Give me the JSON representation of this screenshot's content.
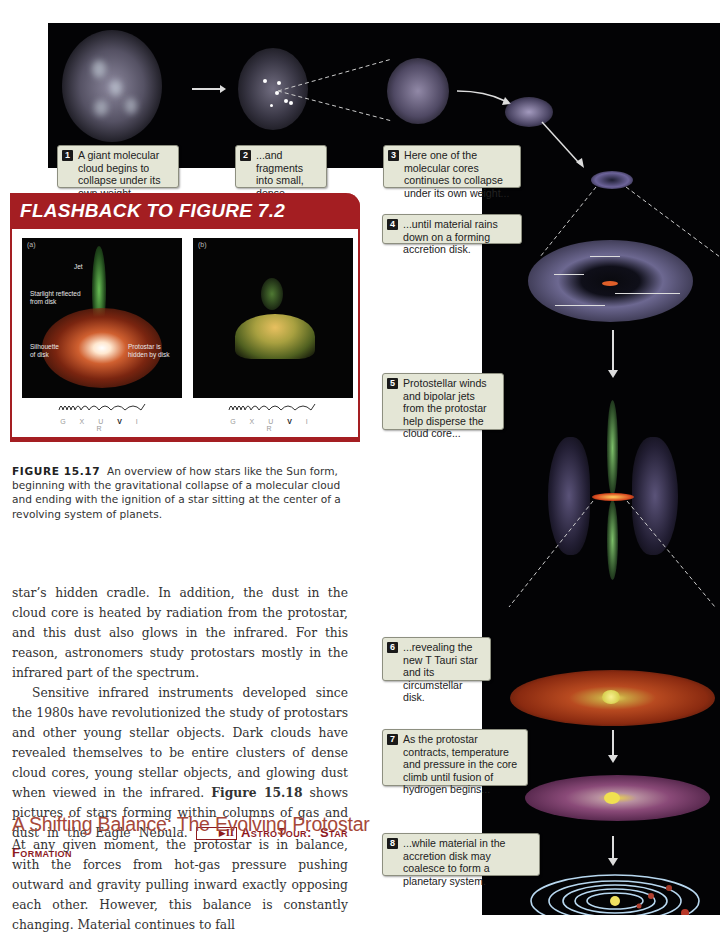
{
  "figure": {
    "callouts": [
      {
        "num": "1",
        "text": "A giant molecular cloud begins to collapse under its own weight..."
      },
      {
        "num": "2",
        "text": "...and fragments into small, dense molecular cores."
      },
      {
        "num": "3",
        "text": "Here one of the molecular cores continues to collapse under its own weight..."
      },
      {
        "num": "4",
        "text": "...until material rains down on a forming accretion disk."
      },
      {
        "num": "5",
        "text": "Protostellar winds and bipolar jets from the protostar help disperse the cloud core..."
      },
      {
        "num": "6",
        "text": "...revealing the new T Tauri star and its circumstellar disk."
      },
      {
        "num": "7",
        "text": "As the protostar contracts, temperature and pressure in the core climb until fusion of hydrogen begins..."
      },
      {
        "num": "8",
        "text": "...while material in the accretion disk may coalesce to form a planetary system."
      }
    ],
    "colors": {
      "background": "#030305",
      "callout_bg": "#e4e6d6",
      "accent_red": "#a41e22"
    }
  },
  "flashback": {
    "title": "FLASHBACK TO FIGURE 7.2",
    "panel_a": {
      "label": "(a)",
      "annotations": {
        "jet": "Jet",
        "starlight": "Starlight reflected from disk",
        "silhouette": "Silhouette of disk",
        "protostar": "Protostar is hidden by disk"
      },
      "spectrum_bands": [
        "G",
        "X",
        "U",
        "V",
        "I",
        "R"
      ],
      "highlighted_band": "V"
    },
    "panel_b": {
      "label": "(b)",
      "spectrum_bands": [
        "G",
        "X",
        "U",
        "V",
        "I",
        "R"
      ],
      "highlighted_band": "V"
    }
  },
  "caption": {
    "label": "FIGURE 15.17",
    "text": "An overview of how stars like the Sun form, beginning with the gravitational collapse of a molecular cloud and ending with the ignition of a star sitting at the center of a revolving system of planets."
  },
  "body": {
    "p1": "star’s hidden cradle. In addition, the dust in the cloud core is heated by radiation from the protostar, and this dust also glows in the infrared. For this reason, astronomers study protostars mostly in the infrared part of the spectrum.",
    "p2_start": "Sensitive infrared instruments developed since the 1980s have revolutionized the study of protostars and other young stellar objects. Dark clouds have revealed themselves to be entire clusters of dense cloud cores, young stellar objects, and glowing dust when viewed in the infrared. ",
    "p2_figref": "Figure 15.18",
    "p2_end": " shows pictures of stars forming within columns of gas and dust in the Eagle Nebula. ",
    "astrotour_icon": "▶II",
    "astrotour_label": "AstroTour: Star Formation",
    "heading": "A Shifting Balance: The Evolving Protostar",
    "p3": "At any given moment, the protostar is in balance, with the forces from hot-gas pressure pushing outward and gravity pulling inward exactly opposing each other. However, this balance is constantly changing. Material continues to fall"
  }
}
